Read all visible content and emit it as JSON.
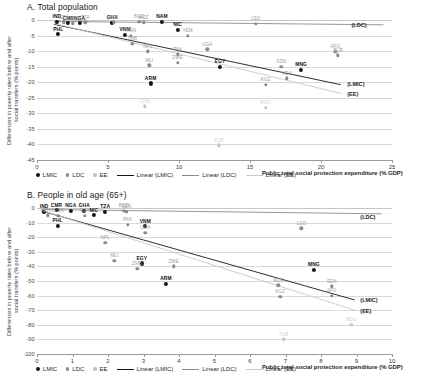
{
  "legend": {
    "items": [
      {
        "label": "LMIC",
        "kind": "dot",
        "color": "#171717"
      },
      {
        "label": "LDC",
        "kind": "dot",
        "color": "#8a8a8a"
      },
      {
        "label": "EE",
        "kind": "dot",
        "color": "#c3c3c3"
      },
      {
        "label": "Linear (LMIC)",
        "kind": "line",
        "color": "#171717"
      },
      {
        "label": "Linear (LDC)",
        "kind": "line",
        "color": "#8a8a8a"
      },
      {
        "label": "Linear (EE)",
        "kind": "line",
        "color": "#c9c9c9"
      }
    ]
  },
  "chart_data": [
    {
      "type": "scatter",
      "panel": "A",
      "title": "A. Total population",
      "xlabel": "Public total social protection expenditure (% GDP)",
      "ylabel": "Differences in poverty rates before and after\nsocial transfers (% points)",
      "xlim": [
        0,
        25
      ],
      "ylim": [
        -45,
        0
      ],
      "xticks": [
        0,
        5,
        10,
        15,
        20,
        25
      ],
      "yticks": [
        0,
        -5,
        -10,
        -15,
        -20,
        -25,
        -30,
        -35,
        -40,
        -45
      ],
      "grid": true,
      "legend_position": "bottom",
      "series": [
        {
          "name": "LMIC",
          "color": "#171717",
          "points": [
            {
              "label": "IND",
              "x": 1.4,
              "y": -0.6
            },
            {
              "label": "PHL",
              "x": 1.5,
              "y": -4.6
            },
            {
              "label": "CMR",
              "x": 2.2,
              "y": -1.0
            },
            {
              "label": "NGA",
              "x": 3.0,
              "y": -1.0
            },
            {
              "label": "GHA",
              "x": 5.3,
              "y": -0.9
            },
            {
              "label": "VNM",
              "x": 6.2,
              "y": -4.8
            },
            {
              "label": "NAM",
              "x": 8.8,
              "y": -0.6
            },
            {
              "label": "NIC",
              "x": 9.9,
              "y": -3.1
            },
            {
              "label": "ARM",
              "x": 8.0,
              "y": -20.4
            },
            {
              "label": "EGY",
              "x": 12.9,
              "y": -15.0
            },
            {
              "label": "MNG",
              "x": 18.6,
              "y": -16.1
            }
          ]
        },
        {
          "name": "LDC",
          "color": "#8a8a8a",
          "points": [
            {
              "label": "ETH",
              "x": 1.9,
              "y": -0.8
            },
            {
              "label": "COM",
              "x": 2.5,
              "y": -1.0
            },
            {
              "label": "TZA",
              "x": 3.4,
              "y": -0.8
            },
            {
              "label": "SEN",
              "x": 5.4,
              "y": -0.7
            },
            {
              "label": "BGD",
              "x": 7.2,
              "y": -0.6
            },
            {
              "label": "MOZ",
              "x": 7.5,
              "y": -0.8
            },
            {
              "label": "ZMB",
              "x": 6.7,
              "y": -7.6
            },
            {
              "label": "RWA",
              "x": 6.6,
              "y": -5.0
            },
            {
              "label": "LSO",
              "x": 15.4,
              "y": -1.2
            },
            {
              "label": "YEM",
              "x": 10.6,
              "y": -5.0
            },
            {
              "label": "UGA",
              "x": 12.0,
              "y": -9.4
            },
            {
              "label": "NPL",
              "x": 7.8,
              "y": -10.1
            },
            {
              "label": "PAK",
              "x": 9.9,
              "y": -11.0
            },
            {
              "label": "MLI",
              "x": 7.9,
              "y": -14.5
            },
            {
              "label": "ZWE",
              "x": 9.9,
              "y": -13.8
            },
            {
              "label": "SDN",
              "x": 17.2,
              "y": -15.0
            },
            {
              "label": "AFG",
              "x": 21.0,
              "y": -10.3
            },
            {
              "label": "BLR",
              "x": 21.2,
              "y": -11.4
            },
            {
              "label": "MDA",
              "x": 17.6,
              "y": -18.7
            },
            {
              "label": "KGZ",
              "x": 16.1,
              "y": -20.8
            }
          ]
        },
        {
          "name": "EE",
          "color": "#c3c3c3",
          "points": [
            {
              "label": "CHN",
              "x": 7.6,
              "y": -27.8
            },
            {
              "label": "ROU",
              "x": 16.1,
              "y": -28.2
            },
            {
              "label": "TUR",
              "x": 12.8,
              "y": -40.3
            }
          ]
        }
      ],
      "trendlines": [
        {
          "name": "(LMIC)",
          "color": "#171717",
          "x0": 1.2,
          "y0": -1.4,
          "x1": 21.4,
          "y1": -20.8
        },
        {
          "name": "(LDC)",
          "color": "#8a8a8a",
          "x0": 1.2,
          "y0": -0.45,
          "x1": 24.4,
          "y1": -1.55
        },
        {
          "name": "(EE)",
          "color": "#c9c9c9",
          "x0": 1.2,
          "y0": -1.1,
          "x1": 21.4,
          "y1": -23.6
        }
      ],
      "trendline_labels": [
        {
          "text": "(LDC)",
          "x": 22.0,
          "y": -1.55
        },
        {
          "text": "(LMIC)",
          "x": 21.7,
          "y": -20.6
        },
        {
          "text": "(EE)",
          "x": 21.7,
          "y": -23.9
        }
      ]
    },
    {
      "type": "scatter",
      "panel": "B",
      "title": "B. People in old age (65+)",
      "xlabel": "Public total social protection expenditure (% GDP)",
      "ylabel": "Differences in poverty rates before and after\nsocial transfers (% points)",
      "xlim": [
        0,
        10
      ],
      "ylim": [
        -100,
        0
      ],
      "xticks": [
        0,
        1,
        2,
        3,
        4,
        5,
        6,
        7,
        8,
        9,
        10
      ],
      "yticks": [
        0,
        -10,
        -20,
        -30,
        -40,
        -50,
        -60,
        -70,
        -80,
        -90,
        -100
      ],
      "grid": true,
      "legend_position": "bottom",
      "series": [
        {
          "name": "LMIC",
          "color": "#171717",
          "points": [
            {
              "label": "IND",
              "x": 0.2,
              "y": -2.5
            },
            {
              "label": "CMR",
              "x": 0.55,
              "y": -1.5
            },
            {
              "label": "PHL",
              "x": 0.58,
              "y": -12.0
            },
            {
              "label": "NGA",
              "x": 0.95,
              "y": -2.0
            },
            {
              "label": "GHA",
              "x": 1.33,
              "y": -2.0
            },
            {
              "label": "NIC",
              "x": 1.6,
              "y": -5.0
            },
            {
              "label": "TZA",
              "x": 1.92,
              "y": -2.5
            },
            {
              "label": "VNM",
              "x": 3.05,
              "y": -12.5
            },
            {
              "label": "EGY",
              "x": 2.95,
              "y": -38.0
            },
            {
              "label": "ARM",
              "x": 3.63,
              "y": -52.0
            },
            {
              "label": "MNG",
              "x": 7.8,
              "y": -42.5
            }
          ]
        },
        {
          "name": "LDC",
          "color": "#8a8a8a",
          "points": [
            {
              "label": "ETH",
              "x": 0.3,
              "y": -5.0
            },
            {
              "label": "COM",
              "x": 0.6,
              "y": -5.5
            },
            {
              "label": "DZA",
              "x": 1.35,
              "y": -5.5
            },
            {
              "label": "BGD",
              "x": 2.45,
              "y": -2.0
            },
            {
              "label": "SEN",
              "x": 2.52,
              "y": -2.5
            },
            {
              "label": "NPL",
              "x": 1.92,
              "y": -24.0
            },
            {
              "label": "MLI",
              "x": 2.18,
              "y": -36.0
            },
            {
              "label": "ZMB",
              "x": 2.82,
              "y": -41.5
            },
            {
              "label": "PAK",
              "x": 2.55,
              "y": -11.5
            },
            {
              "label": "UGA",
              "x": 3.05,
              "y": -17.0
            },
            {
              "label": "ZWE",
              "x": 3.85,
              "y": -40.0
            },
            {
              "label": "LSO",
              "x": 7.45,
              "y": -14.0
            },
            {
              "label": "MDA",
              "x": 6.8,
              "y": -53.0
            },
            {
              "label": "KGZ",
              "x": 6.85,
              "y": -61.0
            },
            {
              "label": "SDN",
              "x": 8.3,
              "y": -53.5
            },
            {
              "label": "AFG",
              "x": 8.3,
              "y": -60.0
            }
          ]
        },
        {
          "name": "EE",
          "color": "#c3c3c3",
          "points": [
            {
              "label": "TUR",
              "x": 6.95,
              "y": -90.0
            },
            {
              "label": "ROU",
              "x": 8.85,
              "y": -80.0
            }
          ]
        }
      ],
      "trendlines": [
        {
          "name": "(LMIC)",
          "color": "#171717",
          "x0": 0.12,
          "y0": -2.0,
          "x1": 8.95,
          "y1": -63.0
        },
        {
          "name": "(LDC)",
          "color": "#8a8a8a",
          "x0": 0.12,
          "y0": -1.0,
          "x1": 9.7,
          "y1": -4.0
        },
        {
          "name": "(EE)",
          "color": "#c9c9c9",
          "x0": 0.12,
          "y0": -1.5,
          "x1": 8.95,
          "y1": -70.0
        }
      ],
      "trendline_labels": [
        {
          "text": "(LDC)",
          "x": 9.05,
          "y": -6.0
        },
        {
          "text": "(LMIC)",
          "x": 9.05,
          "y": -63.0
        },
        {
          "text": "(EE)",
          "x": 9.05,
          "y": -70.5
        }
      ]
    }
  ]
}
